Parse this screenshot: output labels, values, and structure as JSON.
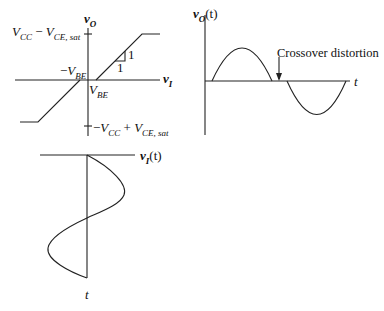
{
  "transfer_characteristic": {
    "y_axis_label_main": "v",
    "y_axis_label_sub": "O",
    "x_axis_label_main": "v",
    "x_axis_label_sub": "I",
    "upper_limit_label": {
      "a": "V",
      "a_sub": "CC",
      "op": " − ",
      "b": "V",
      "b_sub": "CE, sat"
    },
    "lower_limit_label": {
      "pre": "−",
      "a": "V",
      "a_sub": "CC",
      "op": " + ",
      "b": "V",
      "b_sub": "CE, sat"
    },
    "neg_vbe_label": {
      "pre": "−",
      "a": "V",
      "a_sub": "BE"
    },
    "pos_vbe_label": {
      "a": "V",
      "a_sub": "BE"
    },
    "slope_rise": "1",
    "slope_run": "1"
  },
  "output_waveform": {
    "y_axis_label_main": "v",
    "y_axis_label_sub": "O",
    "y_axis_label_arg": "(t)",
    "x_axis_label": "t",
    "annotation": "Crossover distortion"
  },
  "input_waveform": {
    "axis_label_main": "v",
    "axis_label_sub": "I",
    "axis_label_arg": "(t)",
    "time_axis_label": "t"
  }
}
